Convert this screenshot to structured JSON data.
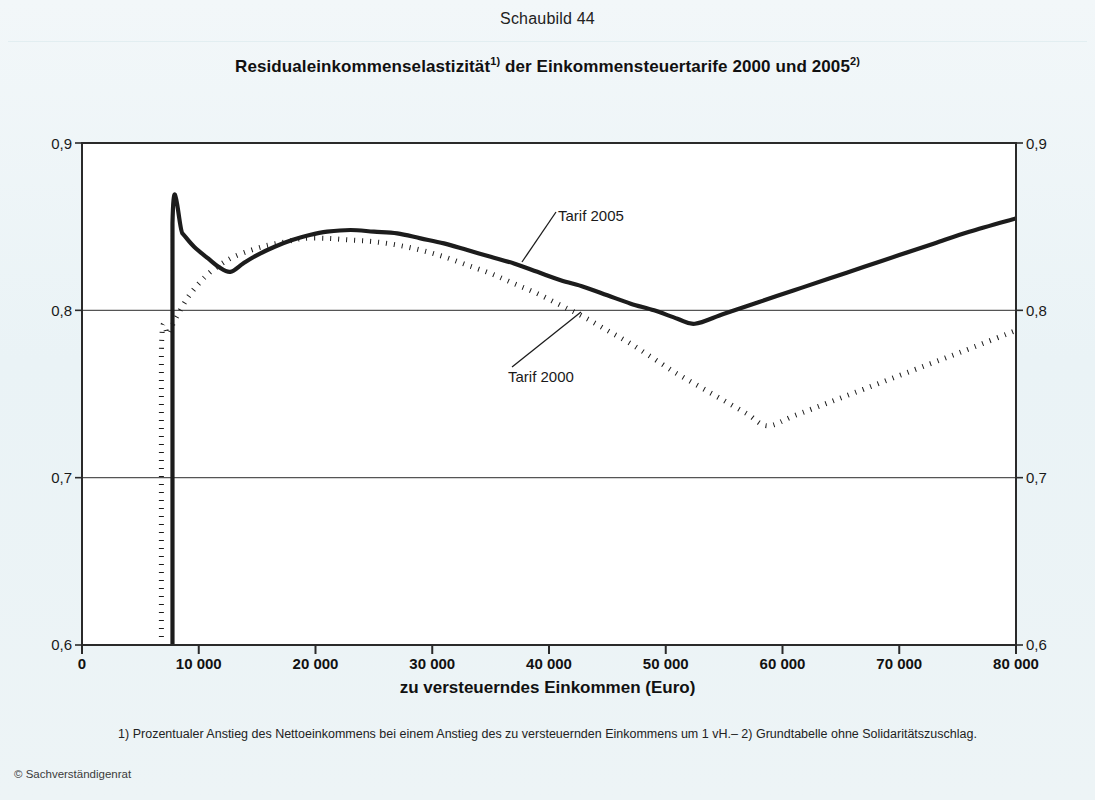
{
  "figure": {
    "number_label": "Schaubild 44",
    "title_main": "Residualeinkommenselastizität",
    "title_sup1": "1)",
    "title_mid": " der Einkommensteuertarife 2000 und 2005",
    "title_sup2": "2)",
    "footnote": "1) Prozentualer Anstieg des Nettoeinkommens bei einem Anstieg des zu versteuernden Einkommens um 1 vH.– 2) Grundtabelle ohne Solidaritätszuschlag.",
    "copyright": "© Sachverständigenrat"
  },
  "axes": {
    "y_ticks_left": [
      "0,9",
      "0,8",
      "0,7",
      "0,6"
    ],
    "y_ticks_right": [
      "0,9",
      "0,8",
      "0,7",
      "0,6"
    ],
    "x_ticks": [
      "0",
      "10 000",
      "20 000",
      "30 000",
      "40 000",
      "50 000",
      "60 000",
      "70 000",
      "80 000"
    ],
    "x_axis_title": "zu versteuerndes Einkommen (Euro)"
  },
  "series_labels": {
    "tarif_2005": "Tarif 2005",
    "tarif_2000": "Tarif 2000"
  },
  "colors": {
    "line": "#1c1c1c",
    "grid": "#555555",
    "frame": "#2a2a2a",
    "background": "#eef5f7",
    "plot_background": "#ffffff"
  },
  "chart_data": {
    "type": "line",
    "title": "Residualeinkommenselastizität1) der Einkommensteuertarife 2000 und 20052)",
    "xlabel": "zu versteuerndes Einkommen (Euro)",
    "ylabel": "",
    "xlim": [
      0,
      80000
    ],
    "ylim": [
      0.6,
      0.9
    ],
    "x_tick_values": [
      0,
      10000,
      20000,
      30000,
      40000,
      50000,
      60000,
      70000,
      80000
    ],
    "y_tick_values": [
      0.6,
      0.7,
      0.8,
      0.9
    ],
    "grid": "horizontal",
    "legend": "inline-annotations",
    "annotations": [
      {
        "text": "Tarif 2005",
        "x": 47000,
        "y": 0.868
      },
      {
        "text": "Tarif 2000",
        "x": 38000,
        "y": 0.762
      }
    ],
    "series": [
      {
        "name": "Tarif 2005",
        "style": "solid",
        "points": [
          [
            7750,
            0.6
          ],
          [
            7750,
            0.852
          ],
          [
            8600,
            0.846
          ],
          [
            9600,
            0.838
          ],
          [
            10800,
            0.831
          ],
          [
            11700,
            0.826
          ],
          [
            12700,
            0.823
          ],
          [
            13800,
            0.828
          ],
          [
            15000,
            0.833
          ],
          [
            16500,
            0.838
          ],
          [
            18000,
            0.842
          ],
          [
            19500,
            0.845
          ],
          [
            21000,
            0.847
          ],
          [
            23000,
            0.848
          ],
          [
            25000,
            0.847
          ],
          [
            27000,
            0.846
          ],
          [
            29000,
            0.843
          ],
          [
            31000,
            0.84
          ],
          [
            33000,
            0.836
          ],
          [
            35000,
            0.832
          ],
          [
            37000,
            0.828
          ],
          [
            39000,
            0.823
          ],
          [
            41000,
            0.818
          ],
          [
            43000,
            0.814
          ],
          [
            45000,
            0.809
          ],
          [
            47000,
            0.804
          ],
          [
            49000,
            0.8
          ],
          [
            51000,
            0.795
          ],
          [
            52500,
            0.792
          ],
          [
            55000,
            0.798
          ],
          [
            58000,
            0.805
          ],
          [
            61000,
            0.812
          ],
          [
            64000,
            0.819
          ],
          [
            67000,
            0.826
          ],
          [
            70000,
            0.833
          ],
          [
            73000,
            0.84
          ],
          [
            76000,
            0.847
          ],
          [
            80000,
            0.855
          ]
        ]
      },
      {
        "name": "Tarif 2000",
        "style": "dotted",
        "points": [
          [
            6800,
            0.6
          ],
          [
            6800,
            0.776
          ],
          [
            7400,
            0.786
          ],
          [
            8100,
            0.796
          ],
          [
            9000,
            0.807
          ],
          [
            10000,
            0.816
          ],
          [
            11000,
            0.823
          ],
          [
            12000,
            0.828
          ],
          [
            13000,
            0.832
          ],
          [
            14500,
            0.836
          ],
          [
            16000,
            0.839
          ],
          [
            17500,
            0.841
          ],
          [
            19000,
            0.843
          ],
          [
            21000,
            0.843
          ],
          [
            23000,
            0.842
          ],
          [
            25000,
            0.841
          ],
          [
            27000,
            0.839
          ],
          [
            29000,
            0.836
          ],
          [
            31000,
            0.832
          ],
          [
            33000,
            0.827
          ],
          [
            35000,
            0.822
          ],
          [
            37000,
            0.816
          ],
          [
            39000,
            0.81
          ],
          [
            41000,
            0.803
          ],
          [
            43000,
            0.796
          ],
          [
            45000,
            0.788
          ],
          [
            47000,
            0.78
          ],
          [
            49000,
            0.771
          ],
          [
            51000,
            0.762
          ],
          [
            53000,
            0.754
          ],
          [
            55000,
            0.746
          ],
          [
            57000,
            0.738
          ],
          [
            58700,
            0.731
          ],
          [
            61000,
            0.737
          ],
          [
            64000,
            0.745
          ],
          [
            67000,
            0.753
          ],
          [
            70000,
            0.761
          ],
          [
            73000,
            0.769
          ],
          [
            76000,
            0.777
          ],
          [
            80000,
            0.788
          ]
        ]
      }
    ]
  }
}
